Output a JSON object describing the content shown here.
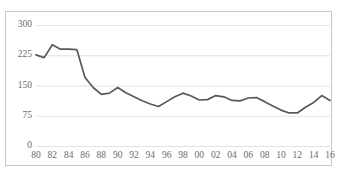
{
  "chart_data": {
    "type": "line",
    "title": "",
    "subtitle": "",
    "xlabel": "",
    "ylabel": "",
    "grid": true,
    "legend": null,
    "legend_position": "none",
    "line_color": "#595959",
    "gridline_color": "#e2e2e2",
    "axis_label_color": "#6b6b6b",
    "border_color": "#c8c8c8",
    "background": "#ffffff",
    "ylim": [
      0,
      300
    ],
    "yticks": [
      0,
      75,
      150,
      225,
      300
    ],
    "ytick_labels": [
      "0",
      "75",
      "150",
      "225",
      "300"
    ],
    "xlim": [
      1980,
      2016
    ],
    "xticks": [
      1980,
      1982,
      1984,
      1986,
      1988,
      1990,
      1992,
      1994,
      1996,
      1998,
      2000,
      2002,
      2004,
      2006,
      2008,
      2010,
      2012,
      2014,
      2016
    ],
    "xtick_labels": [
      "80",
      "82",
      "84",
      "86",
      "88",
      "90",
      "92",
      "94",
      "96",
      "98",
      "00",
      "02",
      "04",
      "06",
      "08",
      "10",
      "12",
      "14",
      "16"
    ],
    "x": [
      1980,
      1981,
      1982,
      1983,
      1984,
      1985,
      1986,
      1987,
      1988,
      1989,
      1990,
      1991,
      1992,
      1993,
      1994,
      1995,
      1996,
      1997,
      1998,
      1999,
      2000,
      2001,
      2002,
      2003,
      2004,
      2005,
      2006,
      2007,
      2008,
      2009,
      2010,
      2011,
      2012,
      2013,
      2014,
      2015,
      2016
    ],
    "values": [
      226,
      219,
      251,
      240,
      240,
      239,
      170,
      145,
      128,
      131,
      145,
      132,
      122,
      112,
      104,
      98,
      110,
      122,
      131,
      124,
      114,
      115,
      125,
      122,
      113,
      112,
      119,
      120,
      110,
      99,
      89,
      82,
      82,
      96,
      108,
      125,
      113
    ],
    "series": [
      {
        "name": "series-1",
        "color": "#595959",
        "values": [
          226,
          219,
          251,
          240,
          240,
          239,
          170,
          145,
          128,
          131,
          145,
          132,
          122,
          112,
          104,
          98,
          110,
          122,
          131,
          124,
          114,
          115,
          125,
          122,
          113,
          112,
          119,
          120,
          110,
          99,
          89,
          82,
          82,
          96,
          108,
          125,
          113
        ]
      }
    ]
  }
}
